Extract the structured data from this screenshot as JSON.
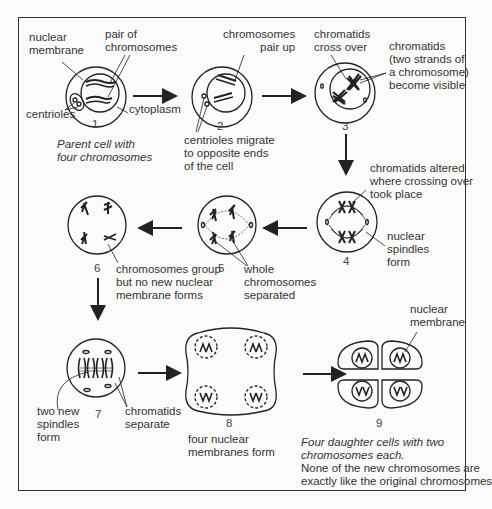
{
  "stages": [
    {
      "number": "1",
      "caption": "Parent cell with four chromosomes",
      "caption_lines": [
        "Parent cell with",
        "four chromosomes"
      ],
      "labels": {
        "nuclear_membrane": [
          "nuclear",
          "membrane"
        ],
        "pair": [
          "pair of",
          "chromosomes"
        ],
        "centrioles": "centrioles",
        "cytoplasm": "cytoplasm"
      }
    },
    {
      "number": "2",
      "labels": {
        "pair_up": [
          "chromosomes",
          "pair up"
        ],
        "centrioles_migrate": [
          "centrioles migrate",
          "to opposite ends",
          "of the cell"
        ]
      }
    },
    {
      "number": "3",
      "labels": {
        "cross_over": [
          "chromatids",
          "cross over"
        ],
        "chromatids_visible": [
          "chromatids",
          "(two strands of",
          "a chromosome)",
          "become visible"
        ]
      }
    },
    {
      "number": "4",
      "labels": {
        "altered": [
          "chromatids altered",
          "where crossing over",
          "took place"
        ],
        "spindles": [
          "nuclear",
          "spindles",
          "form"
        ]
      }
    },
    {
      "number": "5",
      "labels": {
        "separated": [
          "whole",
          "chromosomes",
          "separated"
        ]
      }
    },
    {
      "number": "6",
      "labels": {
        "group": [
          "chromosomes group",
          "but no new nuclear",
          "membrane forms"
        ]
      }
    },
    {
      "number": "7",
      "labels": {
        "new_spindles": [
          "two new",
          "spindles",
          "form"
        ],
        "separate": [
          "chromatids",
          "separate"
        ]
      }
    },
    {
      "number": "8",
      "labels": {
        "membranes": [
          "four nuclear",
          "membranes form"
        ]
      }
    },
    {
      "number": "9",
      "labels": {
        "nuclear_membrane": [
          "nuclear",
          "membrane"
        ]
      },
      "caption_italic": [
        "Four daughter cells with two",
        "chromosomes each."
      ],
      "caption_plain": [
        "None of the new chromosomes are",
        "exactly like the original chromosomes"
      ]
    }
  ]
}
